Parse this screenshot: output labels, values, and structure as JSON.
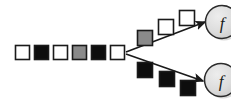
{
  "diagram": {
    "name": "sequence-branching-diagram",
    "background_color": "#ffffff",
    "width": 231,
    "height": 101,
    "colors": {
      "square_white_fill": "#ffffff",
      "square_black_fill": "#0d0d0d",
      "square_gray_fill": "#8a8a8a",
      "square_border": "#1a1a1a",
      "arrow_color": "#1a1a1a",
      "node_fill": "#dcdcdc",
      "node_border": "#2b2b2b",
      "node_shadow": "#b0b0b0"
    },
    "main_sequence": {
      "label": "main-sequence",
      "squares": [
        {
          "fill": "white",
          "x": 15,
          "y": 45,
          "size": 15
        },
        {
          "fill": "black",
          "x": 34,
          "y": 45,
          "size": 15
        },
        {
          "fill": "white",
          "x": 53,
          "y": 45,
          "size": 15
        },
        {
          "fill": "gray",
          "x": 72,
          "y": 45,
          "size": 15
        },
        {
          "fill": "black",
          "x": 91,
          "y": 45,
          "size": 15
        },
        {
          "fill": "white",
          "x": 110,
          "y": 45,
          "size": 15
        }
      ]
    },
    "branches": [
      {
        "label": "upper-branch",
        "squares": [
          {
            "fill": "gray",
            "x": 137,
            "y": 30,
            "size": 16
          },
          {
            "fill": "white",
            "x": 158,
            "y": 19,
            "size": 16
          },
          {
            "fill": "white",
            "x": 179,
            "y": 10,
            "size": 16
          }
        ],
        "arrow": {
          "x1": 126,
          "y1": 52,
          "x2": 208,
          "y2": 21
        },
        "target_node": "node-f-upper"
      },
      {
        "label": "lower-branch",
        "squares": [
          {
            "fill": "black",
            "x": 137,
            "y": 62,
            "size": 16
          },
          {
            "fill": "black",
            "x": 159,
            "y": 71,
            "size": 16
          },
          {
            "fill": "black",
            "x": 180,
            "y": 80,
            "size": 16
          }
        ],
        "arrow": {
          "x1": 126,
          "y1": 54,
          "x2": 206,
          "y2": 82
        },
        "target_node": "node-f-lower"
      }
    ],
    "nodes": [
      {
        "name": "node-f-upper",
        "label": "f",
        "cx": 222,
        "cy": 22,
        "r": 17
      },
      {
        "name": "node-f-lower",
        "label": "f",
        "cx": 221,
        "cy": 80,
        "r": 17
      }
    ]
  }
}
